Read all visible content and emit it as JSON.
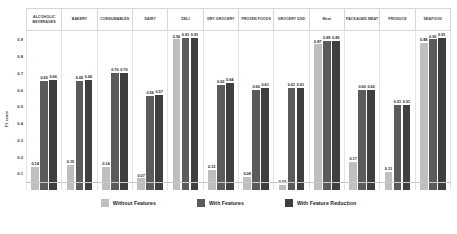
{
  "chart_data": {
    "type": "bar",
    "title": "",
    "xlabel": "",
    "ylabel": "F1 score",
    "ylim": [
      0,
      0.95
    ],
    "grid": false,
    "legend_position": "bottom",
    "ytick_labels": [
      "0.9",
      "0.8",
      "0.7",
      "0.6",
      "0.5",
      "0.4",
      "0.3",
      "0.2",
      "0.1"
    ],
    "ytick_values": [
      0.9,
      0.8,
      0.7,
      0.6,
      0.5,
      0.4,
      0.3,
      0.2,
      0.1
    ],
    "categories": [
      "ALCOHOLIC BEVERAGES",
      "BAKERY",
      "CONSUMABLES",
      "DAIRY",
      "DELI",
      "DRY GROCERY",
      "FROZEN FOODS",
      "GROCERY DSD",
      "Meat",
      "PACKAGED MEAT",
      "PRODUCE",
      "SEAFOOD"
    ],
    "series": [
      {
        "name": "Without Features",
        "color": "#bfbfbf",
        "values": [
          0.14,
          0.15,
          0.14,
          0.07,
          0.9,
          0.12,
          0.08,
          0.03,
          0.87,
          0.17,
          0.11,
          0.88
        ],
        "labels": [
          "0.14",
          "0.15",
          "0.14",
          "0.07",
          "0.90",
          "0.12",
          "0.08",
          "0.03",
          "0.87",
          "0.17",
          "0.11",
          "0.88"
        ]
      },
      {
        "name": "With Features",
        "color": "#5b5b5b",
        "values": [
          0.65,
          0.65,
          0.7,
          0.56,
          0.91,
          0.63,
          0.6,
          0.61,
          0.89,
          0.6,
          0.51,
          0.9
        ],
        "labels": [
          "0.65",
          "0.65",
          "0.70",
          "0.56",
          "0.91",
          "0.63",
          "0.60",
          "0.61",
          "0.89",
          "0.60",
          "0.51",
          "0.90"
        ]
      },
      {
        "name": "With Feature Reduction",
        "color": "#3f3f3f",
        "values": [
          0.66,
          0.66,
          0.7,
          0.57,
          0.91,
          0.64,
          0.61,
          0.61,
          0.89,
          0.6,
          0.51,
          0.91
        ],
        "labels": [
          "0.66",
          "0.66",
          "0.70",
          "0.57",
          "0.91",
          "0.64",
          "0.61",
          "0.61",
          "0.89",
          "0.60",
          "0.51",
          "0.91"
        ]
      }
    ]
  }
}
